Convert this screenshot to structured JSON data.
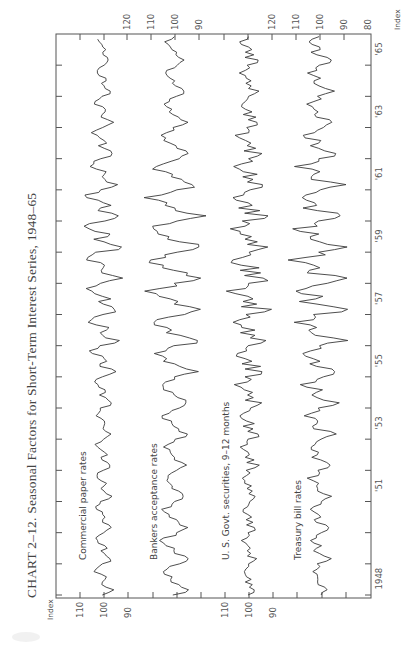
{
  "title": "CHART 2–12. Seasonal Factors for Short-Term Interest Series, 1948–65",
  "axis": {
    "value_label": "Index",
    "time_labels": [
      {
        "year": 1948,
        "label": "1948"
      },
      {
        "year": 1951,
        "label": "'51"
      },
      {
        "year": 1953,
        "label": "'53"
      },
      {
        "year": 1955,
        "label": "'55"
      },
      {
        "year": 1957,
        "label": "'57"
      },
      {
        "year": 1959,
        "label": "'59"
      },
      {
        "year": 1961,
        "label": "'61"
      },
      {
        "year": 1963,
        "label": "'63"
      },
      {
        "year": 1965,
        "label": "'65"
      }
    ]
  },
  "panels": [
    {
      "name": "Commercial paper rates",
      "baseline": 100,
      "left_axis_labels": [
        "110",
        "100",
        "90"
      ],
      "right_axis_labels": []
    },
    {
      "name": "Bankers acceptance rates",
      "baseline": 100,
      "left_axis_labels": [],
      "right_axis_labels": [
        "120",
        "110",
        "100",
        "90"
      ]
    },
    {
      "name": "U. S. Govt. securities, 9–12 months",
      "baseline": 100,
      "left_axis_labels": [
        "110",
        "100",
        "90"
      ],
      "right_axis_labels": []
    },
    {
      "name": "Treasury bill rates",
      "baseline": 100,
      "left_axis_labels": [],
      "right_axis_labels": [
        "120",
        "110",
        "100",
        "90",
        "80"
      ]
    }
  ],
  "chart_data": {
    "type": "line",
    "title": "CHART 2–12. Seasonal Factors for Short-Term Interest Series, 1948–65",
    "xlabel": "Year",
    "ylabel": "Index",
    "x_range": [
      1948,
      1966
    ],
    "x_ticks": [
      1948,
      1949,
      1950,
      1951,
      1952,
      1953,
      1954,
      1955,
      1956,
      1957,
      1958,
      1959,
      1960,
      1961,
      1962,
      1963,
      1964,
      1965,
      1966
    ],
    "x_tick_labels": [
      "1948",
      "'51",
      "'53",
      "'55",
      "'57",
      "'59",
      "'61",
      "'63",
      "'65"
    ],
    "orientation": "rotated 90° counter-clockwise (time runs bottom to top)",
    "grid": false,
    "legend": "inline labels per panel",
    "series": [
      {
        "name": "Commercial paper rates",
        "ylim": [
          87,
          113
        ],
        "y_ticks": [
          90,
          100,
          110
        ],
        "start_year": 1948,
        "amplitude_by_year": [
          3.5,
          3.5,
          3.5,
          3.0,
          3.0,
          3.0,
          4.0,
          5.0,
          6.0,
          7.0,
          7.5,
          7.5,
          7.0,
          6.0,
          4.5,
          3.5,
          3.0,
          2.5
        ],
        "monthly_pattern": [
          0.2,
          -0.6,
          -0.9,
          -0.4,
          0.1,
          0.3,
          -0.2,
          -0.1,
          0.4,
          0.9,
          1.0,
          0.6
        ],
        "end_year": 1965.9
      },
      {
        "name": "Bankers acceptance rates",
        "ylim": [
          88,
          122
        ],
        "y_ticks": [
          90,
          100,
          110,
          120
        ],
        "start_year": 1948,
        "amplitude_by_year": [
          5.0,
          6.0,
          5.0,
          4.0,
          4.0,
          5.0,
          6.0,
          8.0,
          9.5,
          10.5,
          11.0,
          11.0,
          10.0,
          8.5,
          6.0,
          4.5,
          4.0,
          3.5
        ],
        "monthly_pattern": [
          -0.1,
          -0.7,
          -1.0,
          -0.6,
          -0.2,
          0.1,
          0.3,
          0.5,
          0.8,
          1.0,
          0.6,
          0.2
        ],
        "end_year": 1966.0
      },
      {
        "name": "U. S. Govt. securities, 9–12 months",
        "ylim": [
          88,
          112
        ],
        "y_ticks": [
          90,
          100,
          110
        ],
        "start_year": 1948,
        "amplitude_by_year": [
          2.5,
          2.5,
          2.5,
          3.0,
          3.5,
          4.0,
          5.0,
          6.0,
          7.0,
          7.5,
          8.0,
          7.5,
          7.0,
          6.0,
          5.0,
          4.0,
          3.5,
          3.5
        ],
        "monthly_pattern": [
          0.1,
          -0.8,
          -1.0,
          0.2,
          -0.5,
          0.4,
          -0.3,
          0.3,
          0.7,
          1.0,
          0.3,
          0.0
        ],
        "end_year": 1966.0
      },
      {
        "name": "Treasury bill rates",
        "ylim": [
          80,
          120
        ],
        "y_ticks": [
          80,
          90,
          100,
          110,
          120
        ],
        "start_year": 1948,
        "amplitude_by_year": [
          3.0,
          4.0,
          4.0,
          4.5,
          5.0,
          6.0,
          7.0,
          8.5,
          10.0,
          11.0,
          11.5,
          11.0,
          10.0,
          8.5,
          7.0,
          6.0,
          5.0,
          5.0
        ],
        "monthly_pattern": [
          0.0,
          -0.6,
          -1.0,
          -0.5,
          0.2,
          0.5,
          0.2,
          0.1,
          0.6,
          1.0,
          0.4,
          0.1
        ],
        "end_year": 1966.0
      }
    ]
  }
}
